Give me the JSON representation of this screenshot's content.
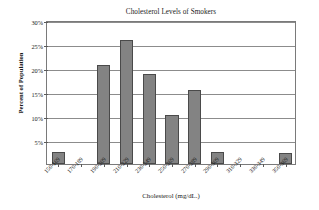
{
  "chart_data": {
    "type": "bar",
    "title": "Cholesterol Levels of Smokers",
    "xlabel": "Cholesterol (mg/dL.)",
    "ylabel": "Percent of Population",
    "categories": [
      "150-169",
      "170-189",
      "190-209",
      "210-229",
      "230-249",
      "250-269",
      "270-289",
      "290-309",
      "310-329",
      "330-349",
      "350-369"
    ],
    "values": [
      2.5,
      0,
      20.7,
      25.9,
      18.7,
      10.2,
      15.4,
      2.4,
      0,
      0,
      2.3
    ],
    "ylim": [
      0,
      30
    ],
    "ytick_values": [
      30,
      25,
      20,
      15,
      10,
      5
    ],
    "ytick_labels": [
      "30%",
      "25%",
      "20%",
      "15%",
      "10%",
      "5%"
    ],
    "grid": true,
    "legend": false,
    "bar_color": "#838383",
    "bar_border_color": "#4a4a4a",
    "gridline_color": "#8c8c8c",
    "plot_border_color": "#7a7a7a",
    "background_color": "#ffffff"
  }
}
